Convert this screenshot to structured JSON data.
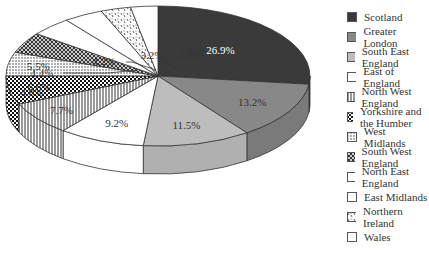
{
  "chart_data": {
    "type": "pie",
    "style": "3d-pie",
    "title": "",
    "legend_position": "right",
    "categories": [
      "Scotland",
      "Greater London",
      "South East England",
      "East of England",
      "North West England",
      "Yorkshire and the Humber",
      "West Midlands",
      "South West England",
      "North East England",
      "East Midlands",
      "Northern Ireland",
      "Wales"
    ],
    "values": [
      26.9,
      13.2,
      11.5,
      9.2,
      7.7,
      6.6,
      5.5,
      4.8,
      4.4,
      4.2,
      3.2,
      2.9
    ],
    "labels": [
      "26.9%",
      "13.2%",
      "11.5%",
      "9.2%",
      "7.7%",
      "6.6%",
      "5.5%",
      "4.8%",
      "4.4%",
      "4.2%",
      "3.2%",
      "2.9%"
    ]
  },
  "legend": [
    {
      "label": "Scotland",
      "fill": "#3a3a3a",
      "pattern": "solid"
    },
    {
      "label": "Greater London",
      "fill": "#888888",
      "pattern": "solid"
    },
    {
      "label": "South East England",
      "fill": "#bdbdbd",
      "pattern": "solid"
    },
    {
      "label": "East of England",
      "fill": "#ffffff",
      "pattern": "solid"
    },
    {
      "label": "North West England",
      "fill": "#ffffff",
      "pattern": "vlines"
    },
    {
      "label": "Yorkshire and the Humber",
      "fill": "#ffffff",
      "pattern": "checker"
    },
    {
      "label": "West Midlands",
      "fill": "#ffffff",
      "pattern": "dots"
    },
    {
      "label": "South West England",
      "fill": "#ffffff",
      "pattern": "diamond"
    },
    {
      "label": "North East England",
      "fill": "#ffffff",
      "pattern": "solid"
    },
    {
      "label": "East Midlands",
      "fill": "#ffffff",
      "pattern": "solid"
    },
    {
      "label": "Northern Ireland",
      "fill": "#ffffff",
      "pattern": "confetti"
    },
    {
      "label": "Wales",
      "fill": "#ffffff",
      "pattern": "solid"
    }
  ]
}
